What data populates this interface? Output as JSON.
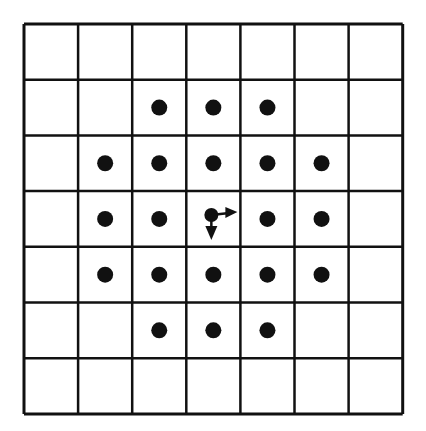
{
  "diagram": {
    "type": "grid-neighborhood",
    "rows": 7,
    "cols": 7,
    "origin": {
      "x": 24,
      "y": 24
    },
    "cell_width": 54.1,
    "cell_height": 55.7,
    "line_color": "#111111",
    "dot_color": "#111111",
    "dot_radius": 8,
    "dots": [
      [
        1,
        2
      ],
      [
        1,
        3
      ],
      [
        1,
        4
      ],
      [
        2,
        1
      ],
      [
        2,
        2
      ],
      [
        2,
        3
      ],
      [
        2,
        4
      ],
      [
        2,
        5
      ],
      [
        3,
        1
      ],
      [
        3,
        2
      ],
      [
        3,
        4
      ],
      [
        3,
        5
      ],
      [
        4,
        1
      ],
      [
        4,
        2
      ],
      [
        4,
        3
      ],
      [
        4,
        4
      ],
      [
        4,
        5
      ],
      [
        5,
        2
      ],
      [
        5,
        3
      ],
      [
        5,
        4
      ]
    ],
    "center": {
      "row": 3,
      "col": 3,
      "arrows": [
        "right",
        "down"
      ]
    }
  }
}
